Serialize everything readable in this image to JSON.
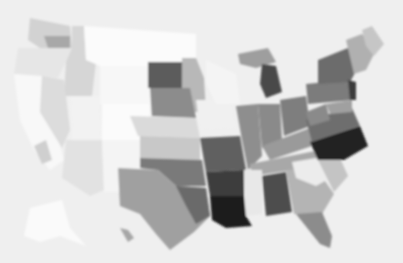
{
  "map": {
    "type": "choropleth",
    "palette": "grayscale",
    "background": "#efefef",
    "regions": [
      {
        "name": "washington",
        "fill": "#d2d2d2",
        "points": "30,18 70,26 72,48 40,48 28,40"
      },
      {
        "name": "washington-puget",
        "fill": "#a8a8a8",
        "points": "44,36 70,36 70,48 48,48"
      },
      {
        "name": "oregon",
        "fill": "#e6e6e6",
        "points": "18,48 72,48 66,62 58,78 14,74"
      },
      {
        "name": "idaho",
        "fill": "#d6d6d6",
        "points": "72,26 84,26 86,60 96,62 92,96 64,96 66,62 72,48"
      },
      {
        "name": "california-north",
        "fill": "#f8f8f8",
        "points": "14,74 42,76 40,112 56,130 64,160 50,170 34,150 20,120"
      },
      {
        "name": "nevada",
        "fill": "#dcdcdc",
        "points": "42,76 64,80 70,130 62,148 40,112"
      },
      {
        "name": "california-south",
        "fill": "#cfcfcf",
        "points": "34,146 46,140 52,160 42,164"
      },
      {
        "name": "montana",
        "fill": "#fbfbfb",
        "points": "84,26 196,34 196,66 150,66 100,66 86,60"
      },
      {
        "name": "wyoming",
        "fill": "#f7f7f7",
        "points": "100,66 150,66 150,104 100,104"
      },
      {
        "name": "utah",
        "fill": "#f2f2f2",
        "points": "70,96 100,96 102,140 72,140"
      },
      {
        "name": "colorado",
        "fill": "#fbfbfb",
        "points": "102,104 150,104 150,140 102,140"
      },
      {
        "name": "arizona",
        "fill": "#e2e2e2",
        "points": "66,140 102,140 104,190 90,196 62,178"
      },
      {
        "name": "new-mexico",
        "fill": "#f4f4f4",
        "points": "102,140 142,140 142,192 104,192"
      },
      {
        "name": "north-dakota",
        "fill": "#5c5c5c",
        "points": "148,62 182,62 182,88 148,88"
      },
      {
        "name": "minnesota",
        "fill": "#b8b8b8",
        "points": "182,58 196,58 204,78 206,112 188,112 182,88"
      },
      {
        "name": "south-dakota",
        "fill": "#8c8c8c",
        "points": "150,88 190,88 196,118 152,116"
      },
      {
        "name": "nebraska",
        "fill": "#dadada",
        "points": "130,116 196,118 200,138 138,136"
      },
      {
        "name": "kansas",
        "fill": "#c8c8c8",
        "points": "140,136 200,138 200,160 140,158"
      },
      {
        "name": "oklahoma",
        "fill": "#7a7a7a",
        "points": "140,158 202,160 206,186 176,186 158,170 140,168"
      },
      {
        "name": "texas",
        "fill": "#a0a0a0",
        "points": "118,168 158,170 176,186 206,188 210,216 194,232 170,250 156,234 140,214 120,206"
      },
      {
        "name": "texas-east",
        "fill": "#6a6a6a",
        "points": "176,186 206,188 210,216 196,224 186,206"
      },
      {
        "name": "iowa",
        "fill": "#f0f0f0",
        "points": "196,100 230,100 236,128 200,130"
      },
      {
        "name": "wisconsin",
        "fill": "#f4f4f4",
        "points": "206,60 236,74 240,104 216,104 206,84"
      },
      {
        "name": "missouri",
        "fill": "#606060",
        "points": "200,138 240,136 246,170 206,172"
      },
      {
        "name": "arkansas",
        "fill": "#3c3c3c",
        "points": "206,172 244,170 244,196 210,196"
      },
      {
        "name": "louisiana",
        "fill": "#1e1e1e",
        "points": "210,196 244,196 246,216 252,226 226,228 212,220"
      },
      {
        "name": "illinois",
        "fill": "#8e8e8e",
        "points": "236,106 258,104 262,156 248,170 242,140"
      },
      {
        "name": "michigan-up",
        "fill": "#9e9e9e",
        "points": "238,54 268,48 276,62 256,68 240,64"
      },
      {
        "name": "michigan",
        "fill": "#4a4a4a",
        "points": "262,64 276,66 282,92 266,98 260,84"
      },
      {
        "name": "indiana",
        "fill": "#8a8a8a",
        "points": "258,104 280,104 282,140 262,148"
      },
      {
        "name": "ohio",
        "fill": "#7e7e7e",
        "points": "280,100 306,96 310,126 284,136"
      },
      {
        "name": "kentucky",
        "fill": "#9a9a9a",
        "points": "262,146 310,128 318,144 270,160"
      },
      {
        "name": "tennessee",
        "fill": "#a8a8a8",
        "points": "250,164 320,150 322,166 252,176"
      },
      {
        "name": "mississippi",
        "fill": "#e8e8e8",
        "points": "244,170 262,170 262,214 246,216"
      },
      {
        "name": "alabama",
        "fill": "#4e4e4e",
        "points": "262,176 286,172 292,212 266,216"
      },
      {
        "name": "georgia",
        "fill": "#b4b4b4",
        "points": "286,170 316,168 334,194 322,214 294,214"
      },
      {
        "name": "georgia-n",
        "fill": "#ececec",
        "points": "292,162 316,158 334,176 316,186 296,178"
      },
      {
        "name": "south-carolina",
        "fill": "#c4c4c4",
        "points": "318,160 340,158 348,176 334,192"
      },
      {
        "name": "north-carolina",
        "fill": "#202020",
        "points": "310,142 360,126 368,146 344,160 318,160"
      },
      {
        "name": "virginia",
        "fill": "#6e6e6e",
        "points": "306,120 352,108 360,126 312,142"
      },
      {
        "name": "west-virginia",
        "fill": "#8a8a8a",
        "points": "306,112 326,104 330,120 310,126"
      },
      {
        "name": "pennsylvania",
        "fill": "#7c7c7c",
        "points": "306,84 348,80 352,100 308,104"
      },
      {
        "name": "new-york",
        "fill": "#6c6c6c",
        "points": "318,60 348,48 360,64 350,82 318,84"
      },
      {
        "name": "new-jersey",
        "fill": "#3a3a3a",
        "points": "348,80 356,82 356,100 350,100"
      },
      {
        "name": "maryland",
        "fill": "#a0a0a0",
        "points": "326,104 352,100 352,112 330,114"
      },
      {
        "name": "new-england",
        "fill": "#b0b0b0",
        "points": "346,40 362,34 376,50 366,70 354,74"
      },
      {
        "name": "maine",
        "fill": "#c6c6c6",
        "points": "362,30 372,26 384,44 374,56 366,46"
      },
      {
        "name": "florida",
        "fill": "#8c8c8c",
        "points": "296,214 322,212 332,236 330,248 320,244 304,224"
      },
      {
        "name": "alaska",
        "fill": "#fafafa",
        "points": "30,208 62,200 70,228 86,246 60,236 40,242 24,236"
      },
      {
        "name": "hawaii",
        "fill": "#a6a6a6",
        "points": "120,228 128,230 134,238 128,242"
      }
    ]
  }
}
